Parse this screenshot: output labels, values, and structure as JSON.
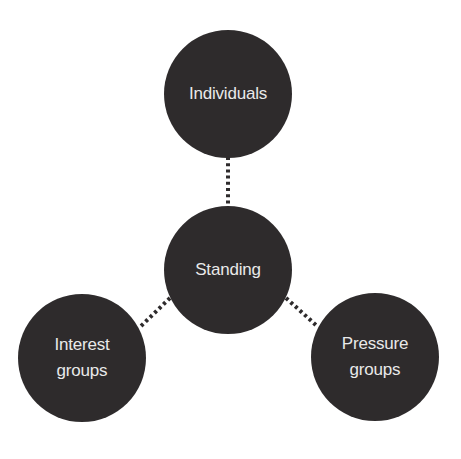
{
  "diagram": {
    "type": "hub-and-spoke",
    "colors": {
      "node_fill": "#2e2b2c",
      "node_text": "#e9e9e9",
      "connector": "#2e2b2c",
      "background": "#ffffff"
    },
    "nodes": {
      "center": {
        "label": "Standing"
      },
      "top": {
        "label": "Individuals"
      },
      "left": {
        "label": "Interest\ngroups"
      },
      "right": {
        "label": "Pressure\ngroups"
      }
    },
    "connectors": [
      {
        "from": "center",
        "to": "top",
        "style": "dotted"
      },
      {
        "from": "center",
        "to": "left",
        "style": "dotted"
      },
      {
        "from": "center",
        "to": "right",
        "style": "dotted"
      }
    ]
  }
}
